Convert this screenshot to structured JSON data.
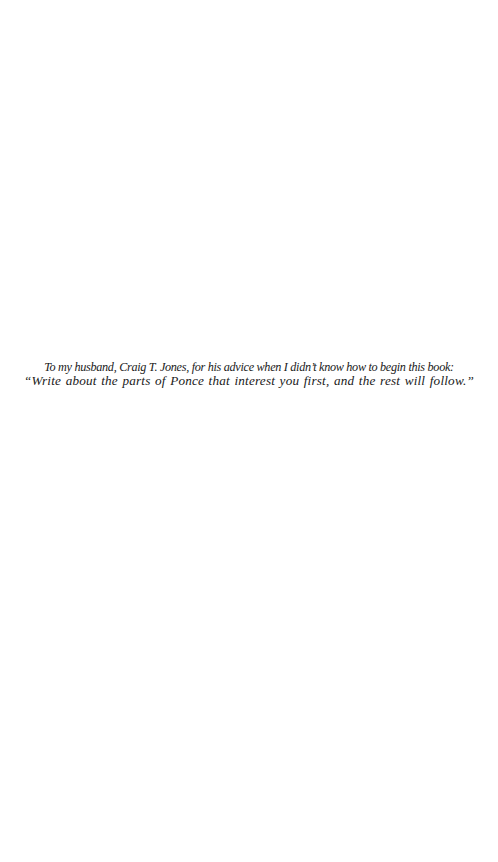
{
  "page": {
    "dedication": {
      "line1": "To my husband, Craig T. Jones, for his advice when I didn’t know how to begin this book:",
      "line2": "“Write about the parts of Ponce that interest you first, and the rest will follow.”"
    }
  }
}
